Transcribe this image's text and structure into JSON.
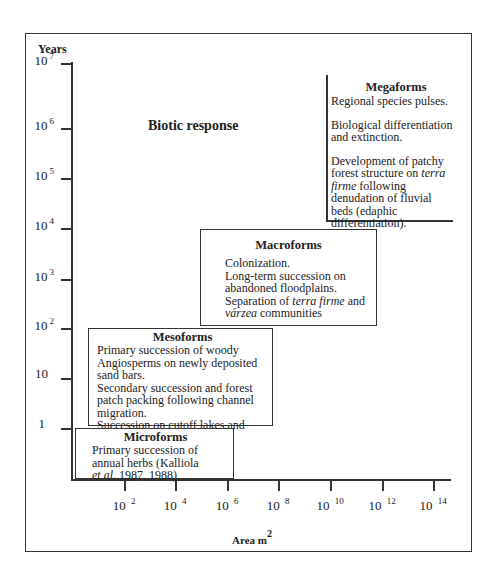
{
  "chart_data": {
    "type": "diagram",
    "title": "Biotic response",
    "ylabel": "Years",
    "xlabel": "Area m",
    "xlabel_superscript": "2",
    "y_ticks": [
      {
        "base": "10",
        "exp": "7"
      },
      {
        "base": "10",
        "exp": "6"
      },
      {
        "base": "10",
        "exp": "5"
      },
      {
        "base": "10",
        "exp": "4"
      },
      {
        "base": "10",
        "exp": "3"
      },
      {
        "base": "10",
        "exp": "2"
      },
      {
        "base": "10",
        "exp": ""
      },
      {
        "base": "1",
        "exp": ""
      }
    ],
    "x_ticks": [
      {
        "base": "10",
        "exp": "2"
      },
      {
        "base": "10",
        "exp": "4"
      },
      {
        "base": "10",
        "exp": "6"
      },
      {
        "base": "10",
        "exp": "8"
      },
      {
        "base": "10",
        "exp": "10"
      },
      {
        "base": "10",
        "exp": "12"
      },
      {
        "base": "10",
        "exp": "14"
      }
    ],
    "regions": [
      {
        "name": "Microforms",
        "area_range_m2": [
          "<10^2",
          "10^5"
        ],
        "time_range_years": [
          "<1",
          "1"
        ],
        "lines": [
          "Primary succession of",
          "annual herbs (Kalliola",
          "et al. 1987, 1988)"
        ]
      },
      {
        "name": "Mesoforms",
        "area_range_m2": [
          "~10^1",
          "~10^5.5"
        ],
        "time_range_years": [
          "1",
          "10^2"
        ],
        "lines": [
          "Primary succession of woody",
          "Angiosperms on newly deposited",
          "sand bars.",
          "Secondary succession and forest",
          "patch packing following channel",
          "migration.",
          "Succession on cutoff lakes and",
          "abandoned paranas"
        ]
      },
      {
        "name": "Macroforms",
        "area_range_m2": [
          "~10^5",
          "~10^12"
        ],
        "time_range_years": [
          "10^2",
          "10^4"
        ],
        "lines": [
          "Colonization.",
          "Long-term succession on",
          "abandoned floodplains.",
          "Separation of terra firme and",
          "várzea communities"
        ]
      },
      {
        "name": "Megaforms",
        "area_range_m2": [
          "10^10",
          ">10^14"
        ],
        "time_range_years": [
          "~10^4.1",
          ">10^7"
        ],
        "lines": [
          "Regional species pulses.",
          "Biological differentiation and extinction.",
          "Development of patchy forest structure on terra firme following denudation of fluvial beds (edaphic differentiation)."
        ]
      }
    ]
  },
  "labels": {
    "years": "Years",
    "biotic": "Biotic   response",
    "area": "Area  m",
    "area_sup": "2"
  },
  "micro": {
    "title": "Microforms",
    "l1": "Primary succession of",
    "l2": "annual herbs (Kalliola",
    "l3a": "et al.",
    "l3b": " 1987, 1988)"
  },
  "meso": {
    "title": "Mesoforms",
    "l1": "Primary succession of woody",
    "l2": "Angiosperms on newly deposited",
    "l3": "sand bars.",
    "l4": "Secondary succession and forest",
    "l5": "patch packing following channel",
    "l6": "migration.",
    "l7": "Succession on cutoff lakes and",
    "l8a": "abandoned  ",
    "l8b": "paranas"
  },
  "macro": {
    "title": "Macroforms",
    "l1": "Colonization.",
    "l2": "Long-term succession on",
    "l3": "abandoned floodplains.",
    "l4a": "Separation of ",
    "l4b": "terra firme",
    "l4c": " and",
    "l5a": "várzea",
    "l5b": " communities"
  },
  "mega": {
    "title": "Megaforms",
    "p1": "Regional species pulses.",
    "p2": "Biological differentiation and extinction.",
    "p3a": "Development of patchy forest structure on ",
    "p3b": "terra firme",
    "p3c": " following denudation of fluvial beds (edaphic differentiation)."
  }
}
